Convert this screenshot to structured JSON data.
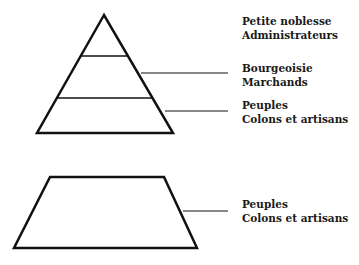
{
  "pyramid": {
    "labels": [
      {
        "line1": "Petite noblesse",
        "line2": "Administrateurs"
      },
      {
        "line1": "Bourgeoisie",
        "line2": "Marchands"
      },
      {
        "line1": "Peuples",
        "line2": "Colons et artisans"
      }
    ]
  },
  "trapezoid": {
    "label": {
      "line1": "Peuples",
      "line2": "Colons et artisans"
    }
  },
  "colors": {
    "stroke": "#111111",
    "text": "#1a1a1a",
    "background": "#ffffff"
  }
}
